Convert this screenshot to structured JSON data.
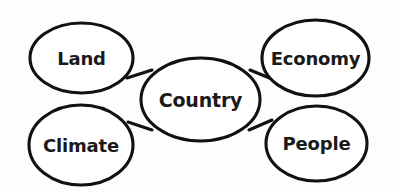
{
  "diagram": {
    "type": "concept-map",
    "background_color": "#fdfdfd",
    "stroke_color": "#111111",
    "fill_color": "#ffffff",
    "text_color": "#1a1a1a",
    "center_node": {
      "id": "country",
      "label": "Country",
      "cx": 200.5,
      "cy": 99.5,
      "rx": 59.5,
      "ry": 41.5,
      "font_size": 19
    },
    "outer_nodes": [
      {
        "id": "land",
        "label": "Land",
        "cx": 81.5,
        "cy": 58,
        "rx": 51.5,
        "ry": 35,
        "font_size": 18
      },
      {
        "id": "climate",
        "label": "Climate",
        "cx": 81,
        "cy": 145,
        "rx": 52,
        "ry": 40,
        "font_size": 18
      },
      {
        "id": "economy",
        "label": "Economy",
        "cx": 315.5,
        "cy": 58,
        "rx": 53.5,
        "ry": 38,
        "font_size": 18
      },
      {
        "id": "people",
        "label": "People",
        "cx": 316.5,
        "cy": 143.5,
        "rx": 50.5,
        "ry": 37.5,
        "font_size": 18
      }
    ],
    "connectors": [
      {
        "id": "land-country",
        "from": "land",
        "to": "country",
        "x1": 127,
        "y1": 78,
        "x2": 152,
        "y2": 70
      },
      {
        "id": "climate-country",
        "from": "climate",
        "to": "country",
        "x1": 128,
        "y1": 122,
        "x2": 152,
        "y2": 130
      },
      {
        "id": "country-economy",
        "from": "country",
        "to": "economy",
        "x1": 250,
        "y1": 70,
        "x2": 272,
        "y2": 79
      },
      {
        "id": "country-people",
        "from": "country",
        "to": "people",
        "x1": 249,
        "y1": 130,
        "x2": 272,
        "y2": 120
      }
    ]
  },
  "chart_data": {
    "type": "diagram",
    "center": "Country",
    "branches": [
      "Land",
      "Climate",
      "Economy",
      "People"
    ],
    "edges": [
      [
        "Country",
        "Land"
      ],
      [
        "Country",
        "Climate"
      ],
      [
        "Country",
        "Economy"
      ],
      [
        "Country",
        "People"
      ]
    ]
  }
}
